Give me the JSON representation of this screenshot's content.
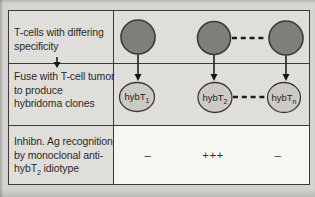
{
  "table": {
    "row1": {
      "lines": [
        "T-cells with differing",
        "specificity"
      ]
    },
    "row2": {
      "lines": [
        "Fuse with T-cell tumor",
        "to produce",
        "hybridoma clones"
      ]
    },
    "row3": {
      "label_lines": [
        "Inhibn. Ag recognition",
        "by monoclonal anti-"
      ],
      "label_line3": {
        "base": "hybT",
        "sub": "2",
        "rest": " idiotype"
      },
      "values": [
        "–",
        "+++",
        "–"
      ]
    }
  },
  "diagram": {
    "nodes": [
      {
        "base": "hybT",
        "sub": "1"
      },
      {
        "base": "hybT",
        "sub": "2"
      },
      {
        "base": "hybT",
        "sub": "n"
      }
    ]
  },
  "colors": {
    "page_bg": "#d5d4d0",
    "cell_bg": "#e0deda",
    "white_cell_bg": "#f7f6f2",
    "line": "#3b3a38",
    "tcell_fill": "#807e7a",
    "hyb_fill": "#cdcac5",
    "text": "#2b2a26"
  }
}
